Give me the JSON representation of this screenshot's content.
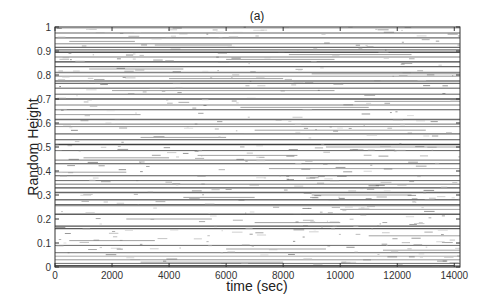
{
  "chart_data": {
    "type": "line",
    "title": "(a)",
    "xlabel": "time (sec)",
    "ylabel": "Random Height",
    "xlim": [
      0,
      14200
    ],
    "ylim": [
      0,
      1
    ],
    "xticks": [
      0,
      2000,
      4000,
      6000,
      8000,
      10000,
      12000,
      14000
    ],
    "yticks": [
      0,
      0.1,
      0.2,
      0.3,
      0.4,
      0.5,
      0.6,
      0.7,
      0.8,
      0.9,
      1
    ],
    "grid": false,
    "legend": null,
    "series": [
      {
        "name": "long-lived traces",
        "heights": [
          0.995,
          0.975,
          0.955,
          0.93,
          0.915,
          0.905,
          0.895,
          0.875,
          0.855,
          0.835,
          0.81,
          0.795,
          0.775,
          0.765,
          0.745,
          0.72,
          0.7,
          0.675,
          0.655,
          0.615,
          0.595,
          0.585,
          0.555,
          0.53,
          0.51,
          0.485,
          0.445,
          0.43,
          0.38,
          0.36,
          0.345,
          0.33,
          0.31,
          0.28,
          0.26,
          0.255,
          0.22,
          0.17,
          0.16,
          0.09,
          0.06,
          0.045,
          0.03,
          0.015,
          0.005
        ],
        "x_start": 0,
        "x_end": 14200
      },
      {
        "name": "short traces",
        "segments": [
          [
            0.94,
            500,
            2800
          ],
          [
            0.925,
            3500,
            6200
          ],
          [
            0.885,
            8200,
            12500
          ],
          [
            0.865,
            6000,
            9800
          ],
          [
            0.825,
            1200,
            4500
          ],
          [
            0.805,
            9000,
            14200
          ],
          [
            0.785,
            4000,
            8000
          ],
          [
            0.735,
            2000,
            9800
          ],
          [
            0.69,
            10500,
            14200
          ],
          [
            0.665,
            6500,
            11000
          ],
          [
            0.635,
            0,
            3000
          ],
          [
            0.57,
            7000,
            13000
          ],
          [
            0.54,
            3000,
            6000
          ],
          [
            0.5,
            9500,
            14200
          ],
          [
            0.465,
            5000,
            8500
          ],
          [
            0.455,
            1000,
            4000
          ],
          [
            0.41,
            7500,
            14200
          ],
          [
            0.395,
            0,
            2500
          ],
          [
            0.3,
            9000,
            12500
          ],
          [
            0.29,
            4500,
            7000
          ],
          [
            0.24,
            10000,
            14200
          ],
          [
            0.2,
            2500,
            5500
          ],
          [
            0.185,
            7000,
            10000
          ],
          [
            0.13,
            11000,
            14200
          ],
          [
            0.11,
            500,
            3500
          ],
          [
            0.075,
            6000,
            9500
          ],
          [
            0.07,
            11500,
            14200
          ],
          [
            0.02,
            3000,
            8000
          ]
        ]
      }
    ]
  }
}
